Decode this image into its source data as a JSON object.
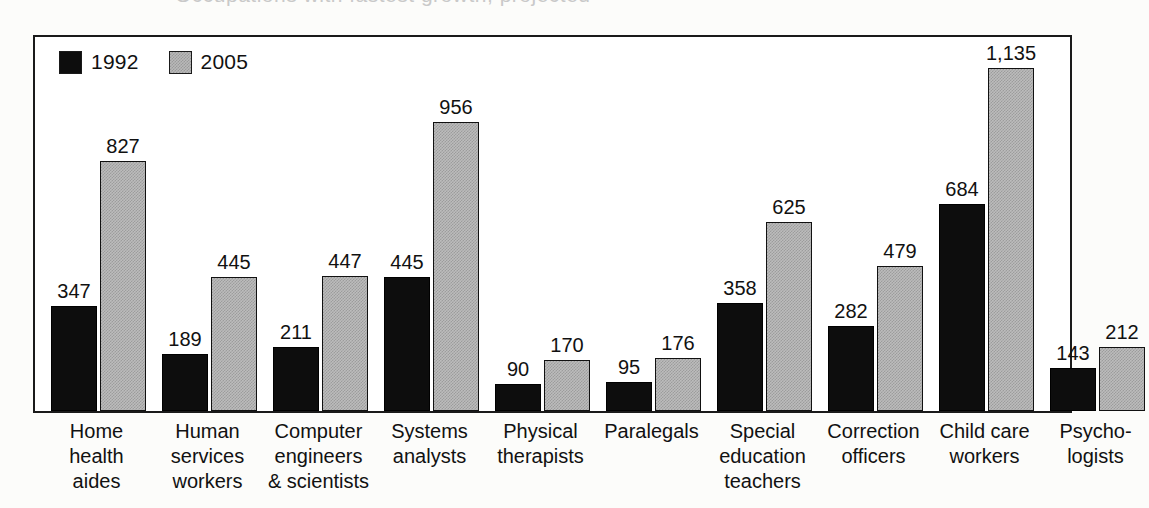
{
  "ghost_title": "Occupations with fastest growth, projected",
  "legend": {
    "position": "top-left",
    "items": [
      {
        "label": "1992",
        "swatch": "black-square-icon",
        "color": "#0d0d0d"
      },
      {
        "label": "2005",
        "swatch": "gray-square-icon",
        "color": "#bcbcbc"
      }
    ]
  },
  "chart_data": {
    "type": "bar",
    "title": "",
    "subtitle": "",
    "xlabel": "",
    "ylabel": "",
    "ylim": [
      0,
      1135
    ],
    "grid": false,
    "legend_position": "top-left",
    "categories": [
      "Home\nhealth\naides",
      "Human\nservices\nworkers",
      "Computer\nengineers\n& scientists",
      "Systems\nanalysts",
      "Physical\ntherapists",
      "Paralegals",
      "Special\neducation\nteachers",
      "Correction\nofficers",
      "Child care\nworkers",
      "Psycho-\nlogists"
    ],
    "series": [
      {
        "name": "1992",
        "color": "#0d0d0d",
        "values": [
          347,
          189,
          211,
          445,
          90,
          95,
          358,
          282,
          684,
          143
        ],
        "labels": [
          "347",
          "189",
          "211",
          "445",
          "90",
          "95",
          "358",
          "282",
          "684",
          "143"
        ]
      },
      {
        "name": "2005",
        "color": "#bcbcbc",
        "values": [
          827,
          445,
          447,
          956,
          170,
          176,
          625,
          479,
          1135,
          212
        ],
        "labels": [
          "827",
          "445",
          "447",
          "956",
          "170",
          "176",
          "625",
          "479",
          "1,135",
          "212"
        ]
      }
    ]
  }
}
